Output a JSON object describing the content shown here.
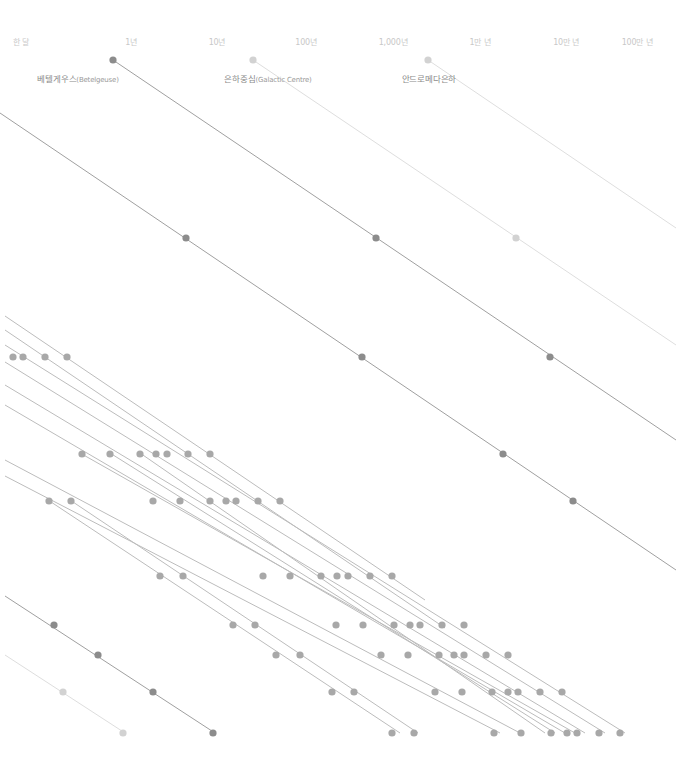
{
  "axis": {
    "ticks": [
      {
        "label": "한 달",
        "x": 21
      },
      {
        "label": "1년",
        "x": 131
      },
      {
        "label": "10년",
        "x": 217
      },
      {
        "label": "100년",
        "x": 306
      },
      {
        "label": "1,000년",
        "x": 393
      },
      {
        "label": "1만 년",
        "x": 480
      },
      {
        "label": "10만 년",
        "x": 566
      },
      {
        "label": "100만 년",
        "x": 637
      }
    ]
  },
  "labels": [
    {
      "ko": "베텔게우스",
      "en": "(Betelgeuse)",
      "x": 78,
      "y": 72
    },
    {
      "ko": "은하중심",
      "en": "(Galactic Centre)",
      "x": 268,
      "y": 72
    },
    {
      "ko": "안드로메다은하",
      "en": "",
      "x": 429,
      "y": 72
    }
  ],
  "colors": {
    "dark_dot": "#8c8c8c",
    "mid_dot": "#a8a8a8",
    "light_dot": "#d2d2d2",
    "dark_line": "#a0a0a0",
    "mid_line": "#bcbcbc",
    "light_line": "#dedede"
  },
  "lines": [
    {
      "x1": 113,
      "y1": 60,
      "x2": 676,
      "y2": 440,
      "tone": "dark"
    },
    {
      "x1": 253,
      "y1": 60,
      "x2": 676,
      "y2": 345,
      "tone": "light"
    },
    {
      "x1": 428,
      "y1": 60,
      "x2": 676,
      "y2": 228,
      "tone": "light"
    },
    {
      "x1": 0,
      "y1": 113,
      "x2": 676,
      "y2": 570,
      "tone": "dark"
    },
    {
      "x1": 5,
      "y1": 316,
      "x2": 425,
      "y2": 600,
      "tone": "mid"
    },
    {
      "x1": 5,
      "y1": 330,
      "x2": 445,
      "y2": 628,
      "tone": "mid"
    },
    {
      "x1": 5,
      "y1": 345,
      "x2": 625,
      "y2": 733,
      "tone": "mid"
    },
    {
      "x1": 5,
      "y1": 362,
      "x2": 605,
      "y2": 733,
      "tone": "mid"
    },
    {
      "x1": 5,
      "y1": 385,
      "x2": 585,
      "y2": 733,
      "tone": "mid"
    },
    {
      "x1": 5,
      "y1": 405,
      "x2": 565,
      "y2": 733,
      "tone": "mid"
    },
    {
      "x1": 5,
      "y1": 460,
      "x2": 520,
      "y2": 733,
      "tone": "mid"
    },
    {
      "x1": 5,
      "y1": 476,
      "x2": 500,
      "y2": 733,
      "tone": "mid"
    },
    {
      "x1": 80,
      "y1": 453,
      "x2": 575,
      "y2": 733,
      "tone": "mid"
    },
    {
      "x1": 110,
      "y1": 453,
      "x2": 555,
      "y2": 733,
      "tone": "mid"
    },
    {
      "x1": 140,
      "y1": 453,
      "x2": 545,
      "y2": 733,
      "tone": "mid"
    },
    {
      "x1": 48,
      "y1": 500,
      "x2": 400,
      "y2": 733,
      "tone": "mid"
    },
    {
      "x1": 70,
      "y1": 500,
      "x2": 418,
      "y2": 733,
      "tone": "mid"
    },
    {
      "x1": 5,
      "y1": 596,
      "x2": 215,
      "y2": 733,
      "tone": "dark"
    },
    {
      "x1": 5,
      "y1": 655,
      "x2": 125,
      "y2": 733,
      "tone": "light"
    }
  ],
  "dots": [
    {
      "x": 113,
      "y": 60,
      "tone": "dark"
    },
    {
      "x": 253,
      "y": 60,
      "tone": "light"
    },
    {
      "x": 428,
      "y": 60,
      "tone": "light"
    },
    {
      "x": 186,
      "y": 238,
      "tone": "dark"
    },
    {
      "x": 376,
      "y": 238,
      "tone": "dark"
    },
    {
      "x": 516,
      "y": 238,
      "tone": "light"
    },
    {
      "x": 362,
      "y": 357,
      "tone": "dark"
    },
    {
      "x": 550,
      "y": 357,
      "tone": "dark"
    },
    {
      "x": 503,
      "y": 454,
      "tone": "dark"
    },
    {
      "x": 573,
      "y": 501,
      "tone": "dark"
    },
    {
      "x": 13,
      "y": 357,
      "tone": "mid"
    },
    {
      "x": 23,
      "y": 357,
      "tone": "mid"
    },
    {
      "x": 45,
      "y": 357,
      "tone": "mid"
    },
    {
      "x": 67,
      "y": 357,
      "tone": "mid"
    },
    {
      "x": 82,
      "y": 454,
      "tone": "mid"
    },
    {
      "x": 110,
      "y": 454,
      "tone": "mid"
    },
    {
      "x": 140,
      "y": 454,
      "tone": "mid"
    },
    {
      "x": 156,
      "y": 454,
      "tone": "mid"
    },
    {
      "x": 167,
      "y": 454,
      "tone": "mid"
    },
    {
      "x": 188,
      "y": 454,
      "tone": "mid"
    },
    {
      "x": 210,
      "y": 454,
      "tone": "mid"
    },
    {
      "x": 49,
      "y": 501,
      "tone": "mid"
    },
    {
      "x": 71,
      "y": 501,
      "tone": "mid"
    },
    {
      "x": 153,
      "y": 501,
      "tone": "mid"
    },
    {
      "x": 180,
      "y": 501,
      "tone": "mid"
    },
    {
      "x": 210,
      "y": 501,
      "tone": "mid"
    },
    {
      "x": 226,
      "y": 501,
      "tone": "mid"
    },
    {
      "x": 236,
      "y": 501,
      "tone": "mid"
    },
    {
      "x": 258,
      "y": 501,
      "tone": "mid"
    },
    {
      "x": 280,
      "y": 501,
      "tone": "mid"
    },
    {
      "x": 160,
      "y": 576,
      "tone": "mid"
    },
    {
      "x": 183,
      "y": 576,
      "tone": "mid"
    },
    {
      "x": 263,
      "y": 576,
      "tone": "mid"
    },
    {
      "x": 290,
      "y": 576,
      "tone": "mid"
    },
    {
      "x": 321,
      "y": 576,
      "tone": "mid"
    },
    {
      "x": 337,
      "y": 576,
      "tone": "mid"
    },
    {
      "x": 348,
      "y": 576,
      "tone": "mid"
    },
    {
      "x": 370,
      "y": 576,
      "tone": "mid"
    },
    {
      "x": 392,
      "y": 576,
      "tone": "mid"
    },
    {
      "x": 54,
      "y": 625,
      "tone": "dark"
    },
    {
      "x": 233,
      "y": 625,
      "tone": "mid"
    },
    {
      "x": 255,
      "y": 625,
      "tone": "mid"
    },
    {
      "x": 336,
      "y": 625,
      "tone": "mid"
    },
    {
      "x": 363,
      "y": 625,
      "tone": "mid"
    },
    {
      "x": 394,
      "y": 625,
      "tone": "mid"
    },
    {
      "x": 410,
      "y": 625,
      "tone": "mid"
    },
    {
      "x": 420,
      "y": 625,
      "tone": "mid"
    },
    {
      "x": 442,
      "y": 625,
      "tone": "mid"
    },
    {
      "x": 464,
      "y": 625,
      "tone": "mid"
    },
    {
      "x": 98,
      "y": 655,
      "tone": "dark"
    },
    {
      "x": 276,
      "y": 655,
      "tone": "mid"
    },
    {
      "x": 300,
      "y": 655,
      "tone": "mid"
    },
    {
      "x": 381,
      "y": 655,
      "tone": "mid"
    },
    {
      "x": 408,
      "y": 655,
      "tone": "mid"
    },
    {
      "x": 439,
      "y": 655,
      "tone": "mid"
    },
    {
      "x": 454,
      "y": 655,
      "tone": "mid"
    },
    {
      "x": 464,
      "y": 655,
      "tone": "mid"
    },
    {
      "x": 486,
      "y": 655,
      "tone": "mid"
    },
    {
      "x": 508,
      "y": 655,
      "tone": "mid"
    },
    {
      "x": 63,
      "y": 692,
      "tone": "light"
    },
    {
      "x": 153,
      "y": 692,
      "tone": "dark"
    },
    {
      "x": 332,
      "y": 692,
      "tone": "mid"
    },
    {
      "x": 354,
      "y": 692,
      "tone": "mid"
    },
    {
      "x": 435,
      "y": 692,
      "tone": "mid"
    },
    {
      "x": 462,
      "y": 692,
      "tone": "mid"
    },
    {
      "x": 492,
      "y": 692,
      "tone": "mid"
    },
    {
      "x": 508,
      "y": 692,
      "tone": "mid"
    },
    {
      "x": 518,
      "y": 692,
      "tone": "mid"
    },
    {
      "x": 540,
      "y": 692,
      "tone": "mid"
    },
    {
      "x": 562,
      "y": 692,
      "tone": "mid"
    },
    {
      "x": 123,
      "y": 733,
      "tone": "light"
    },
    {
      "x": 213,
      "y": 733,
      "tone": "dark"
    },
    {
      "x": 392,
      "y": 733,
      "tone": "mid"
    },
    {
      "x": 414,
      "y": 733,
      "tone": "mid"
    },
    {
      "x": 494,
      "y": 733,
      "tone": "mid"
    },
    {
      "x": 521,
      "y": 733,
      "tone": "mid"
    },
    {
      "x": 551,
      "y": 733,
      "tone": "mid"
    },
    {
      "x": 567,
      "y": 733,
      "tone": "mid"
    },
    {
      "x": 577,
      "y": 733,
      "tone": "mid"
    },
    {
      "x": 599,
      "y": 733,
      "tone": "mid"
    },
    {
      "x": 620,
      "y": 733,
      "tone": "mid"
    }
  ]
}
